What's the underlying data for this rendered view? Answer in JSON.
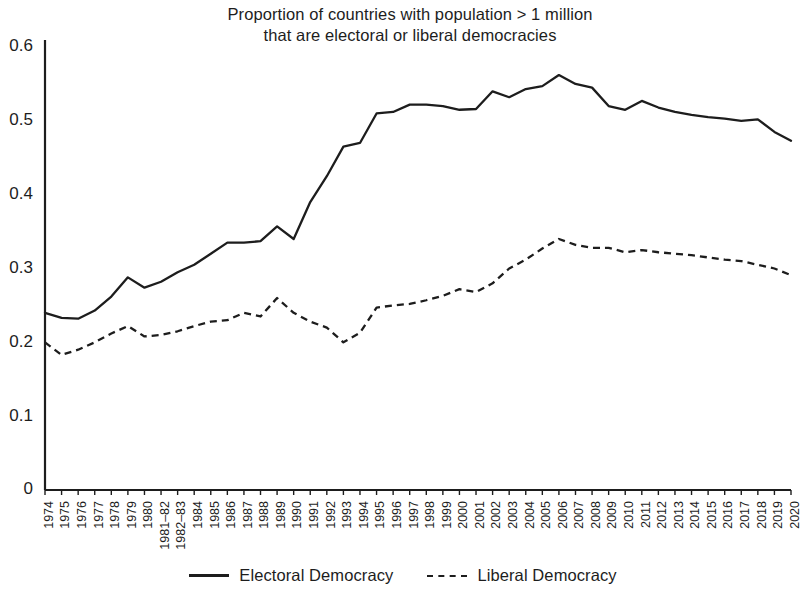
{
  "chart_data": {
    "type": "line",
    "title": "Proportion of countries with population > 1 million that are electoral or liberal democracies",
    "title_line1": "Proportion of countries with population > 1 million",
    "title_line2": "that are electoral or liberal democracies",
    "xlabel": "",
    "ylabel": "",
    "ylim": [
      0,
      0.6
    ],
    "ytick_labels": [
      "0",
      "0.1",
      "0.2",
      "0.3",
      "0.4",
      "0.5",
      "0.6"
    ],
    "ytick_values": [
      0,
      0.1,
      0.2,
      0.3,
      0.4,
      0.5,
      0.6
    ],
    "grid": false,
    "legend_position": "bottom",
    "categories": [
      "1974",
      "1975",
      "1976",
      "1977",
      "1978",
      "1979",
      "1980",
      "1981–82",
      "1982–83",
      "1984",
      "1985",
      "1986",
      "1987",
      "1988",
      "1989",
      "1990",
      "1991",
      "1992",
      "1993",
      "1994",
      "1995",
      "1996",
      "1997",
      "1998",
      "1999",
      "2000",
      "2001",
      "2002",
      "2003",
      "2004",
      "2005",
      "2006",
      "2007",
      "2008",
      "2009",
      "2010",
      "2011",
      "2012",
      "2013",
      "2014",
      "2015",
      "2016",
      "2017",
      "2018",
      "2019",
      "2020"
    ],
    "series": [
      {
        "name": "Electoral Democracy",
        "style": "solid",
        "color": "#1d1d1d",
        "values": [
          0.24,
          0.233,
          0.232,
          0.243,
          0.262,
          0.288,
          0.274,
          0.282,
          0.295,
          0.305,
          0.32,
          0.335,
          0.335,
          0.337,
          0.357,
          0.34,
          0.39,
          0.425,
          0.465,
          0.47,
          0.51,
          0.512,
          0.522,
          0.522,
          0.52,
          0.515,
          0.516,
          0.54,
          0.532,
          0.543,
          0.547,
          0.562,
          0.55,
          0.545,
          0.52,
          0.515,
          0.527,
          0.518,
          0.512,
          0.508,
          0.505,
          0.503,
          0.5,
          0.502,
          0.485,
          0.473
        ]
      },
      {
        "name": "Liberal Democracy",
        "style": "dashed",
        "color": "#1d1d1d",
        "values": [
          0.2,
          0.183,
          0.19,
          0.2,
          0.212,
          0.222,
          0.208,
          0.21,
          0.215,
          0.222,
          0.228,
          0.23,
          0.24,
          0.235,
          0.26,
          0.24,
          0.228,
          0.22,
          0.2,
          0.213,
          0.247,
          0.25,
          0.252,
          0.257,
          0.263,
          0.272,
          0.268,
          0.28,
          0.3,
          0.312,
          0.327,
          0.34,
          0.332,
          0.328,
          0.328,
          0.322,
          0.325,
          0.322,
          0.32,
          0.318,
          0.315,
          0.312,
          0.31,
          0.305,
          0.3,
          0.291
        ]
      }
    ]
  },
  "legend": {
    "entries": [
      {
        "label": "Electoral Democracy",
        "style": "solid"
      },
      {
        "label": "Liberal Democracy",
        "style": "dashed"
      }
    ]
  }
}
